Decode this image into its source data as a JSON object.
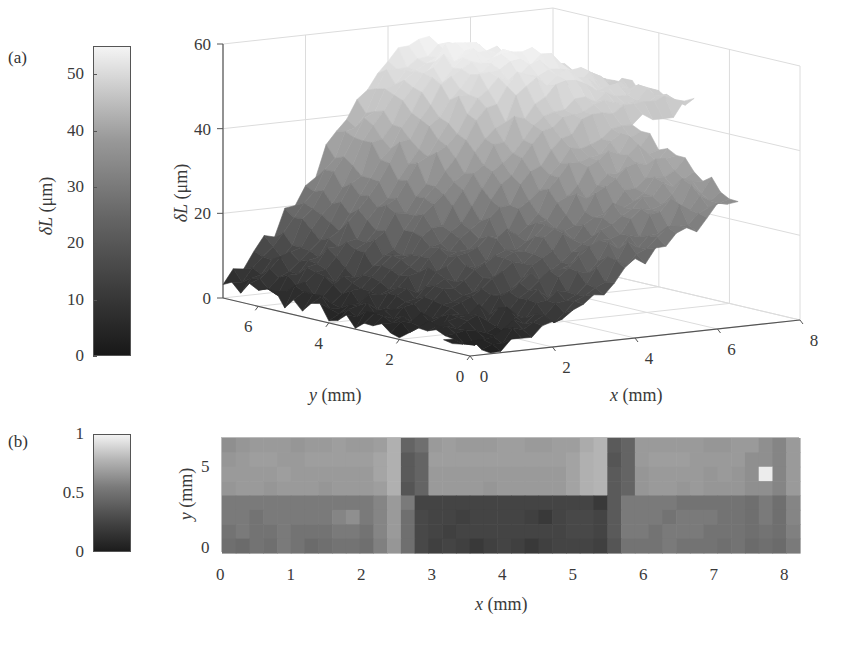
{
  "panels": {
    "a": {
      "label": "(a)"
    },
    "b": {
      "label": "(b)"
    }
  },
  "colorbar_a": {
    "label_symbol": "δL",
    "label_unit": "(μm)",
    "ticks": [
      "0",
      "10",
      "20",
      "30",
      "40",
      "50"
    ],
    "range": [
      0,
      55
    ],
    "colormap": "gray"
  },
  "colorbar_b": {
    "ticks": [
      "0",
      "0.5",
      "1"
    ],
    "range": [
      0,
      1
    ],
    "colormap": "gray"
  },
  "surface_axes": {
    "z_label_symbol": "δL",
    "z_label_unit": "(μm)",
    "z_ticks": [
      "0",
      "20",
      "40",
      "60"
    ],
    "y_label_symbol": "y",
    "y_label_unit": "(mm)",
    "y_ticks": [
      "6",
      "4",
      "2",
      "0"
    ],
    "x_label_symbol": "x",
    "x_label_unit": "(mm)",
    "x_ticks": [
      "0",
      "2",
      "4",
      "6",
      "8"
    ]
  },
  "heatmap_axes": {
    "y_label_symbol": "y",
    "y_label_unit": "(mm)",
    "y_ticks": [
      "0",
      "5"
    ],
    "x_label_symbol": "x",
    "x_label_unit": "(mm)",
    "x_ticks": [
      "0",
      "1",
      "2",
      "3",
      "4",
      "5",
      "6",
      "7",
      "8"
    ]
  },
  "chart_data": [
    {
      "type": "surface",
      "title": "(a)",
      "xlabel": "x (mm)",
      "ylabel": "y (mm)",
      "zlabel": "δL (μm)",
      "xlim": [
        0,
        8
      ],
      "ylim": [
        0,
        7
      ],
      "zlim": [
        0,
        60
      ],
      "colorbar": {
        "label": "δL (μm)",
        "range": [
          0,
          55
        ],
        "ticks": [
          0,
          10,
          20,
          30,
          40,
          50
        ]
      },
      "grid": true,
      "x": [
        0,
        1,
        2,
        3,
        4,
        5,
        6,
        7,
        8
      ],
      "y": [
        0,
        1,
        2,
        3,
        4,
        5,
        6,
        7
      ],
      "z": [
        [
          0,
          2,
          5,
          10,
          18,
          22,
          28,
          30,
          32
        ],
        [
          1,
          3,
          7,
          12,
          20,
          26,
          32,
          34,
          36
        ],
        [
          1,
          4,
          9,
          15,
          22,
          30,
          36,
          38,
          40
        ],
        [
          2,
          5,
          12,
          18,
          26,
          38,
          42,
          44,
          45
        ],
        [
          2,
          6,
          14,
          24,
          36,
          48,
          50,
          48,
          46
        ],
        [
          3,
          8,
          18,
          32,
          46,
          54,
          55,
          50,
          45
        ],
        [
          3,
          10,
          22,
          38,
          50,
          56,
          54,
          48,
          44
        ],
        [
          4,
          12,
          24,
          40,
          52,
          55,
          52,
          46,
          42
        ]
      ]
    },
    {
      "type": "heatmap",
      "title": "(b)",
      "xlabel": "x (mm)",
      "ylabel": "y (mm)",
      "xlim": [
        0,
        8.2
      ],
      "ylim": [
        0,
        7
      ],
      "colorbar": {
        "range": [
          0,
          1
        ],
        "ticks": [
          0,
          0.5,
          1
        ]
      },
      "description": "Normalized map; upper band (y>3.5) mid-gray ~0.55-0.6, lower band darker ~0.45; dark vertical stripes at x≈2.4 and x≈5.6; dark region 2.6<x<5.6 for y<3.5 (~0.2); bright pixel at x≈7.9, y≈5 (~1.0)",
      "rows_top_to_bottom_sample": [
        [
          0.55,
          0.58,
          0.6,
          0.6,
          0.6,
          0.58,
          0.6,
          0.6,
          0.62,
          0.6,
          0.6,
          0.62,
          0.7,
          0.35,
          0.4,
          0.6,
          0.62,
          0.6,
          0.6,
          0.6,
          0.62,
          0.62,
          0.6,
          0.6,
          0.62,
          0.62,
          0.68,
          0.72,
          0.3,
          0.35,
          0.6,
          0.6,
          0.6,
          0.6,
          0.6,
          0.58,
          0.58,
          0.6,
          0.6,
          0.55,
          0.5,
          0.6
        ],
        [
          0.58,
          0.6,
          0.62,
          0.62,
          0.6,
          0.6,
          0.62,
          0.62,
          0.62,
          0.62,
          0.62,
          0.65,
          0.7,
          0.3,
          0.35,
          0.62,
          0.62,
          0.62,
          0.62,
          0.62,
          0.62,
          0.62,
          0.62,
          0.62,
          0.62,
          0.64,
          0.7,
          0.72,
          0.28,
          0.35,
          0.6,
          0.62,
          0.62,
          0.62,
          0.6,
          0.6,
          0.6,
          0.6,
          0.55,
          0.55,
          0.5,
          0.6
        ],
        [
          0.6,
          0.6,
          0.6,
          0.6,
          0.62,
          0.6,
          0.6,
          0.6,
          0.6,
          0.6,
          0.6,
          0.65,
          0.7,
          0.3,
          0.35,
          0.6,
          0.6,
          0.6,
          0.6,
          0.6,
          0.6,
          0.6,
          0.6,
          0.6,
          0.6,
          0.64,
          0.7,
          0.72,
          0.3,
          0.35,
          0.58,
          0.6,
          0.6,
          0.6,
          0.6,
          0.58,
          0.6,
          0.58,
          0.55,
          0.98,
          0.5,
          0.6
        ],
        [
          0.58,
          0.6,
          0.6,
          0.58,
          0.6,
          0.6,
          0.6,
          0.58,
          0.6,
          0.6,
          0.6,
          0.62,
          0.7,
          0.28,
          0.35,
          0.6,
          0.6,
          0.6,
          0.6,
          0.58,
          0.6,
          0.6,
          0.6,
          0.6,
          0.6,
          0.64,
          0.7,
          0.72,
          0.3,
          0.35,
          0.58,
          0.6,
          0.6,
          0.58,
          0.6,
          0.58,
          0.58,
          0.58,
          0.55,
          0.55,
          0.5,
          0.6
        ],
        [
          0.45,
          0.45,
          0.45,
          0.45,
          0.45,
          0.45,
          0.45,
          0.45,
          0.45,
          0.45,
          0.45,
          0.5,
          0.6,
          0.45,
          0.2,
          0.2,
          0.2,
          0.2,
          0.2,
          0.2,
          0.2,
          0.2,
          0.2,
          0.2,
          0.2,
          0.2,
          0.2,
          0.15,
          0.3,
          0.45,
          0.45,
          0.45,
          0.45,
          0.42,
          0.42,
          0.42,
          0.42,
          0.42,
          0.4,
          0.45,
          0.4,
          0.5
        ],
        [
          0.45,
          0.45,
          0.42,
          0.45,
          0.45,
          0.45,
          0.45,
          0.45,
          0.5,
          0.55,
          0.45,
          0.5,
          0.6,
          0.4,
          0.22,
          0.2,
          0.2,
          0.18,
          0.2,
          0.2,
          0.2,
          0.2,
          0.18,
          0.15,
          0.2,
          0.22,
          0.22,
          0.2,
          0.3,
          0.45,
          0.45,
          0.45,
          0.42,
          0.45,
          0.45,
          0.45,
          0.42,
          0.42,
          0.4,
          0.45,
          0.4,
          0.5
        ],
        [
          0.42,
          0.45,
          0.42,
          0.42,
          0.45,
          0.42,
          0.42,
          0.42,
          0.45,
          0.45,
          0.42,
          0.5,
          0.6,
          0.4,
          0.22,
          0.2,
          0.18,
          0.2,
          0.2,
          0.2,
          0.2,
          0.2,
          0.2,
          0.2,
          0.2,
          0.22,
          0.22,
          0.2,
          0.3,
          0.45,
          0.45,
          0.42,
          0.45,
          0.45,
          0.45,
          0.42,
          0.42,
          0.42,
          0.4,
          0.42,
          0.4,
          0.48
        ],
        [
          0.4,
          0.38,
          0.42,
          0.4,
          0.45,
          0.42,
          0.38,
          0.4,
          0.42,
          0.42,
          0.4,
          0.48,
          0.58,
          0.4,
          0.22,
          0.18,
          0.2,
          0.18,
          0.15,
          0.18,
          0.2,
          0.18,
          0.15,
          0.18,
          0.2,
          0.2,
          0.2,
          0.18,
          0.28,
          0.42,
          0.42,
          0.42,
          0.45,
          0.42,
          0.42,
          0.42,
          0.4,
          0.42,
          0.38,
          0.4,
          0.38,
          0.45
        ]
      ]
    }
  ]
}
